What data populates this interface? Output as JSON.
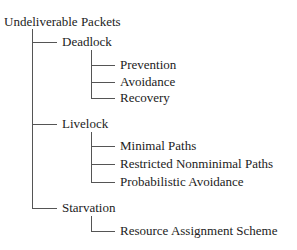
{
  "diagram": {
    "type": "tree",
    "root": "Undeliverable Packets",
    "children": [
      {
        "label": "Deadlock",
        "children": [
          {
            "label": "Prevention"
          },
          {
            "label": "Avoidance"
          },
          {
            "label": "Recovery"
          }
        ]
      },
      {
        "label": "Livelock",
        "children": [
          {
            "label": "Minimal Paths"
          },
          {
            "label": "Restricted Nonminimal Paths"
          },
          {
            "label": "Probabilistic Avoidance"
          }
        ]
      },
      {
        "label": "Starvation",
        "children": [
          {
            "label": "Resource Assignment Scheme"
          }
        ]
      }
    ],
    "line_color": "#555555",
    "text_color": "#222222"
  }
}
